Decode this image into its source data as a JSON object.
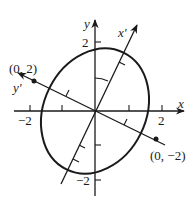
{
  "figure": {
    "axes": {
      "x_label": "x",
      "y_label": "y",
      "x_prime_label": "x'",
      "y_prime_label": "y'"
    },
    "ticks": {
      "x_pos_label": "2",
      "x_neg_label": "−2",
      "y_pos_label": "2",
      "y_neg_label": "−2"
    },
    "points": [
      {
        "label": "(0, 2)",
        "x_prime": 0,
        "y_prime": 2
      },
      {
        "label": "(0, −2)",
        "x_prime": 0,
        "y_prime": -2
      }
    ],
    "ellipse": {
      "center": [
        0,
        0
      ],
      "semi_axis_x_prime": 1.6,
      "semi_axis_y_prime": 2.2
    },
    "rotation_angle_deg": 26,
    "colors": {
      "ink": "#1a1a1a",
      "background": "#ffffff"
    }
  }
}
